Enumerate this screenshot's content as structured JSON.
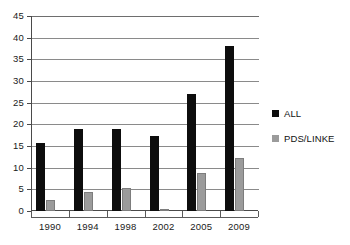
{
  "chart_data": {
    "type": "bar",
    "title": "",
    "xlabel": "",
    "ylabel": "",
    "categories": [
      "1990",
      "1994",
      "1998",
      "2002",
      "2005",
      "2009"
    ],
    "series": [
      {
        "name": "ALL",
        "color": "#0d0d0d",
        "values": [
          15.8,
          18.9,
          18.9,
          17.4,
          27.0,
          38.1
        ]
      },
      {
        "name": "PDS/LINKE",
        "color": "#9b9b9b",
        "values": [
          2.6,
          4.4,
          5.3,
          0.1,
          8.8,
          12.3
        ]
      }
    ],
    "ylim": [
      0,
      45
    ],
    "ytick_step": 5,
    "yticks": [
      "0",
      "5",
      "10",
      "15",
      "20",
      "25",
      "30",
      "35",
      "40",
      "45"
    ],
    "grid": true,
    "legend_position": "right"
  },
  "legend": {
    "entries": [
      {
        "label": "ALL"
      },
      {
        "label": "PDS/LINKE"
      }
    ]
  }
}
